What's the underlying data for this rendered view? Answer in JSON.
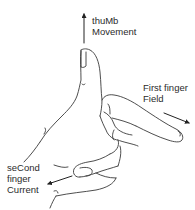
{
  "diagram": {
    "labels": {
      "thumb": {
        "line1": "thuMb",
        "line2": "Movement"
      },
      "first_finger": {
        "line1": "First finger",
        "line2": "Field"
      },
      "second_finger": {
        "line1": "seCond",
        "line2": "finger",
        "line3": "Current"
      }
    },
    "arrows": [
      {
        "name": "thumb-arrow",
        "direction": "up"
      },
      {
        "name": "first-finger-arrow",
        "direction": "down-right"
      },
      {
        "name": "second-finger-arrow",
        "direction": "down-left"
      }
    ],
    "colors": {
      "line": "#3a3a3a",
      "text": "#2b2b2b",
      "background": "#ffffff"
    }
  }
}
